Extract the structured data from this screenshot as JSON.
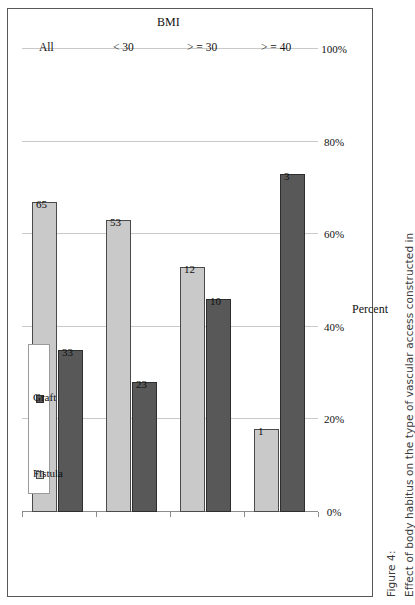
{
  "figure": {
    "label": "Figure 4:",
    "caption": "Effect of body habitus on the type of vascular access constructed in"
  },
  "legend": {
    "position": "upper-left",
    "items": [
      {
        "label": "Fistula",
        "color": "#c9c9c9",
        "swatch_name": "legend-swatch-fistula"
      },
      {
        "label": "Graft",
        "color": "#585858",
        "swatch_name": "legend-swatch-graft"
      }
    ]
  },
  "axes": {
    "value_axis_title": "Percent",
    "category_axis_title": "BMI",
    "value_ticks": [
      "0%",
      "20%",
      "40%",
      "60%",
      "80%",
      "100%"
    ],
    "value_tick_numbers": [
      0,
      20,
      40,
      60,
      80,
      100
    ],
    "category_ticks": [
      "All",
      "< 30",
      "> = 30",
      "> = 40"
    ]
  },
  "chart_data": {
    "type": "bar",
    "orientation": "horizontal",
    "title": "",
    "subtitle": "",
    "xlabel": "Percent",
    "ylabel": "BMI",
    "xlim": [
      0,
      100
    ],
    "grid": true,
    "legend_position": "upper-left",
    "categories": [
      "All",
      "< 30",
      "> = 30",
      "> = 40"
    ],
    "series": [
      {
        "name": "Fistula",
        "color": "#c9c9c9",
        "values": [
          67,
          63,
          53,
          18
        ],
        "labels": [
          "65",
          "53",
          "12",
          "1"
        ]
      },
      {
        "name": "Graft",
        "color": "#585858",
        "values": [
          35,
          28,
          46,
          73
        ],
        "labels": [
          "33",
          "23",
          "10",
          "3"
        ]
      }
    ],
    "note": "Bar lengths are percentages read off the gridlines; printed data labels are counts."
  }
}
